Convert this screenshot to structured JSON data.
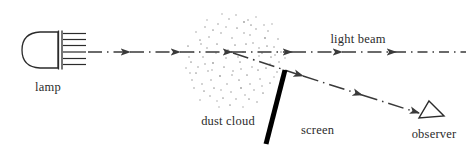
{
  "figure": {
    "type": "optics-ray-diagram",
    "background_color": "#ffffff",
    "width": 475,
    "height": 149
  },
  "labels": {
    "lamp": "lamp",
    "dust_cloud": "dust cloud",
    "light_beam": "light beam",
    "screen": "screen",
    "observer": "observer"
  },
  "colors": {
    "ink": "#2b2b2b",
    "beam": "#3a3a3a",
    "screen": "#000000",
    "dust": "#9a9a9a",
    "lamp_outline": "#2b2b2b"
  },
  "elements": {
    "lamp": {
      "name": "lamp",
      "body_bounds": [
        23,
        32,
        38,
        36
      ],
      "reflector_line_x": 59,
      "filament_lines": 7,
      "hatch_extent": [
        63,
        86
      ]
    },
    "light_beam": {
      "name": "light-beam",
      "style": "dash-dot-with-arrowheads",
      "y": 52,
      "x_start": 88,
      "x_end": 466,
      "arrow_positions": [
        128,
        178,
        228,
        288,
        338,
        392
      ]
    },
    "dust_cloud": {
      "name": "dust-cloud",
      "center": [
        236,
        57
      ],
      "radius": 47,
      "stipple": "random dots"
    },
    "scattered_ray": {
      "name": "scattered-ray",
      "style": "dash-dot-with-arrowheads",
      "from": [
        233,
        53
      ],
      "to": [
        418,
        113
      ],
      "arrow_positions": [
        0.38,
        0.68,
        0.94
      ]
    },
    "screen": {
      "name": "screen",
      "from": [
        284,
        71
      ],
      "to": [
        266,
        144
      ],
      "thickness": 4.5
    },
    "observer": {
      "name": "observer-eye",
      "shape": "triangle-outline",
      "apex": [
        428,
        102
      ],
      "base_left": [
        420,
        117
      ],
      "base_right": [
        443,
        115
      ]
    }
  },
  "label_positions": {
    "lamp": [
      48,
      88
    ],
    "dust_cloud": [
      224,
      122
    ],
    "light_beam": [
      355,
      42
    ],
    "screen": [
      292,
      132
    ],
    "observer": [
      434,
      135
    ]
  }
}
